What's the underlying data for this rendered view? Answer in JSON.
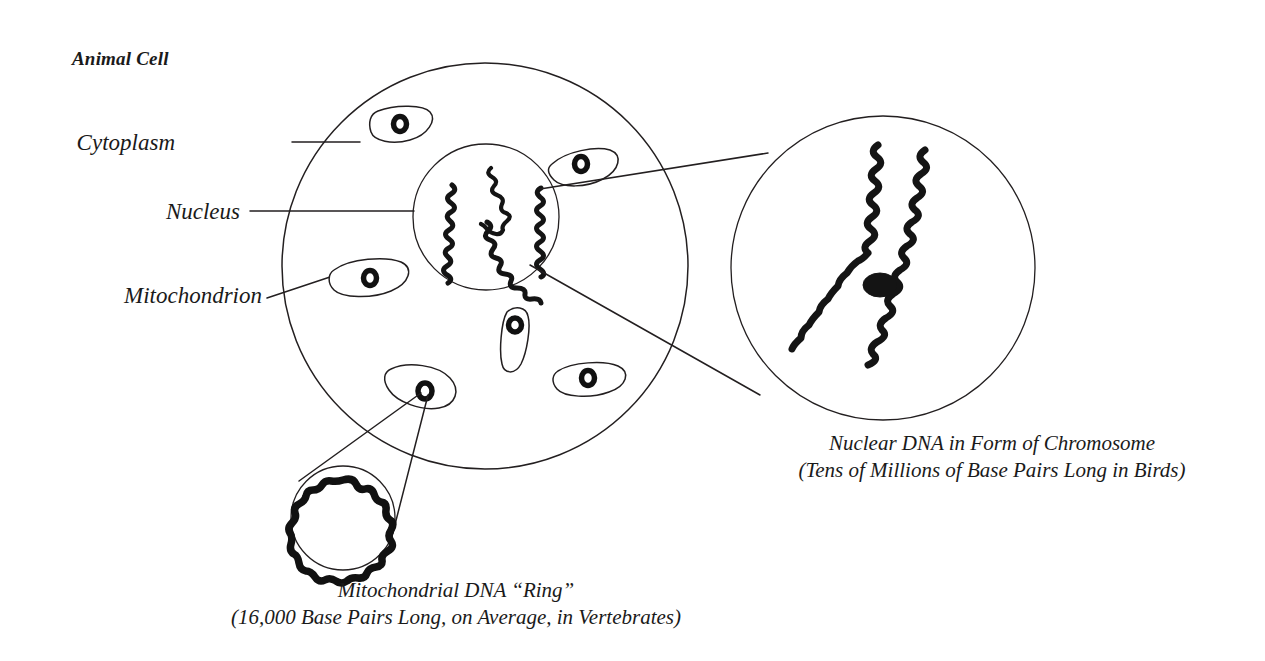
{
  "figure": {
    "title": "Animal Cell",
    "background_color": "#ffffff",
    "ink_color": "#231f20"
  },
  "labels": {
    "cytoplasm": "Cytoplasm",
    "nucleus": "Nucleus",
    "mitochondrion": "Mitochondrion"
  },
  "captions": {
    "nuclear_dna_line1": "Nuclear DNA in Form of Chromosome",
    "nuclear_dna_line2": "(Tens of Millions of Base Pairs Long in Birds)",
    "mito_dna_line1": "Mitochondrial DNA “Ring”",
    "mito_dna_line2": "(16,000 Base Pairs Long, on Average, in Vertebrates)"
  },
  "structures": {
    "cell_membrane": "cell-membrane-circle",
    "nucleus_envelope": "nucleus-circle",
    "chromosome_inset": "chromosome-magnifier-circle",
    "mito_dna_inset": "mitochondrial-dna-magnifier-circle",
    "mitochondria_count": 6,
    "nuclear_chromosomes_count": 3,
    "chromatids_per_chromosome": 2
  },
  "geometry": {
    "cell": {
      "cx": 485,
      "cy": 266,
      "r": 203
    },
    "nucleus": {
      "cx": 486,
      "cy": 217,
      "r": 73
    },
    "chromosome_inset": {
      "cx": 883,
      "cy": 268,
      "r": 152
    },
    "mito_dna_inset": {
      "cx": 343,
      "cy": 518,
      "r": 52
    }
  }
}
